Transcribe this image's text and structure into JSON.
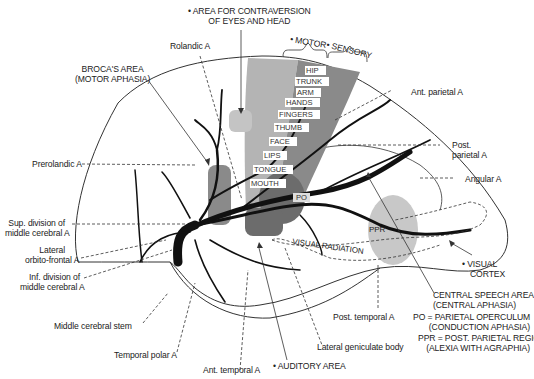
{
  "top_labels": {
    "contraversion": [
      "• AREA FOR CONTRAVERSION",
      "OF EYES AND HEAD"
    ],
    "motor": "• MOTOR",
    "sensory": "• SENSORY"
  },
  "left_labels": {
    "rolandic": "Rolandic A",
    "broca": [
      "BROCA'S AREA",
      "(MOTOR APHASIA)"
    ],
    "prerolandic": "Prerolandic A",
    "sup_division": [
      "Sup. division of",
      "middle cerebral A"
    ],
    "lateral_orbito": [
      "Lateral",
      "orbito-frontal A"
    ],
    "inf_division": [
      "Inf. division of",
      "middle cerebral A"
    ],
    "stem": "Middle cerebral stem",
    "temporal_polar": "Temporal polar A",
    "ant_temporal": "Ant. temporal A"
  },
  "right_labels": {
    "ant_parietal": "Ant. parietal A",
    "post_parietal": [
      "Post.",
      "parietal A"
    ],
    "angular": "Angular A",
    "visual_cortex": [
      "• VISUAL",
      "CORTEX"
    ],
    "central_speech": [
      "CENTRAL SPEECH AREA",
      "(CENTRAL APHASIA)"
    ],
    "po_legend": [
      "PO = PARIETAL OPERCULUM",
      "(CONDUCTION APHASIA)"
    ],
    "ppr_legend": [
      "PPR = POST. PARIETAL REGION",
      "(ALEXIA WITH AGRAPHIA)"
    ],
    "post_temporal": "Post. temporal A",
    "lateral_geniculate": "Lateral geniculate body",
    "auditory": "• AUDITORY AREA"
  },
  "homunculus": [
    "HIP",
    "TRUNK",
    "ARM",
    "HANDS",
    "FINGERS",
    "THUMB",
    "FACE",
    "LIPS",
    "TONGUE",
    "MOUTH"
  ],
  "region_tags": {
    "po": "PO",
    "ppr": "PPR",
    "visual_radiation": "VISUAL RADIATION"
  },
  "colors": {
    "motor_strip": "#b4b4b4",
    "sensory_strip": "#8a8a8a",
    "dark_region": "#6c6c6c",
    "light_region": "#c8c8c8",
    "artery": "#111111"
  }
}
